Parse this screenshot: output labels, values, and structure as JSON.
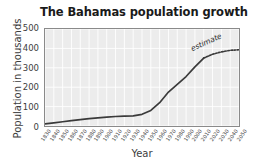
{
  "chart_data": {
    "type": "line",
    "title": "The Bahamas population growth",
    "xlabel": "Year",
    "ylabel": "Population in thousands",
    "xlim": [
      1830,
      2050
    ],
    "ylim": [
      0,
      500
    ],
    "yticks": [
      0,
      100,
      200,
      300,
      400,
      500
    ],
    "xticks": [
      1830,
      1840,
      1850,
      1860,
      1870,
      1880,
      1890,
      1900,
      1910,
      1920,
      1930,
      1940,
      1950,
      1960,
      1970,
      1980,
      1990,
      2000,
      2010,
      2020,
      2030,
      2040,
      2050
    ],
    "grid": true,
    "grid_color": "#ffffff",
    "plot_bgcolor": "#ececec",
    "line_color": "#3a3a3a",
    "legend": "none",
    "annotations": [
      {
        "text": "estimate",
        "x": 2025,
        "y": 420,
        "rotation": -24
      }
    ],
    "series": [
      {
        "name": "Observed population",
        "style": "solid",
        "x": [
          1830,
          1840,
          1850,
          1860,
          1870,
          1880,
          1890,
          1900,
          1910,
          1920,
          1930,
          1940,
          1950,
          1960,
          1970,
          1980,
          1990,
          2000,
          2010
        ],
        "values": [
          11,
          16,
          22,
          28,
          33,
          38,
          42,
          46,
          49,
          51,
          52,
          60,
          80,
          120,
          175,
          215,
          255,
          305,
          350
        ]
      },
      {
        "name": "Projected population (estimate)",
        "style": "dotted",
        "x": [
          2010,
          2020,
          2030,
          2040,
          2050
        ],
        "values": [
          350,
          370,
          382,
          390,
          393
        ]
      }
    ]
  },
  "figure": {
    "title": "The Bahamas population growth",
    "xlabel": "Year",
    "ylabel": "Population in thousands",
    "estimate_label": "estimate"
  }
}
